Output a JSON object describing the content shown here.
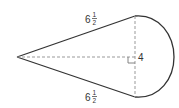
{
  "diagram": {
    "shape": "kite-with-semicircle",
    "colors": {
      "stroke": "#333333",
      "dashed": "#999999",
      "background": "#ffffff"
    },
    "labels": {
      "top_side": {
        "whole": "6",
        "num": "1",
        "den": "2"
      },
      "bottom_side": {
        "whole": "6",
        "num": "1",
        "den": "2"
      },
      "height": "4"
    },
    "geometry": {
      "apex": [
        17,
        57
      ],
      "top": [
        135,
        16
      ],
      "bottom": [
        135,
        97
      ],
      "arc_right": [
        173,
        57
      ]
    },
    "right_angle_marker": true
  }
}
